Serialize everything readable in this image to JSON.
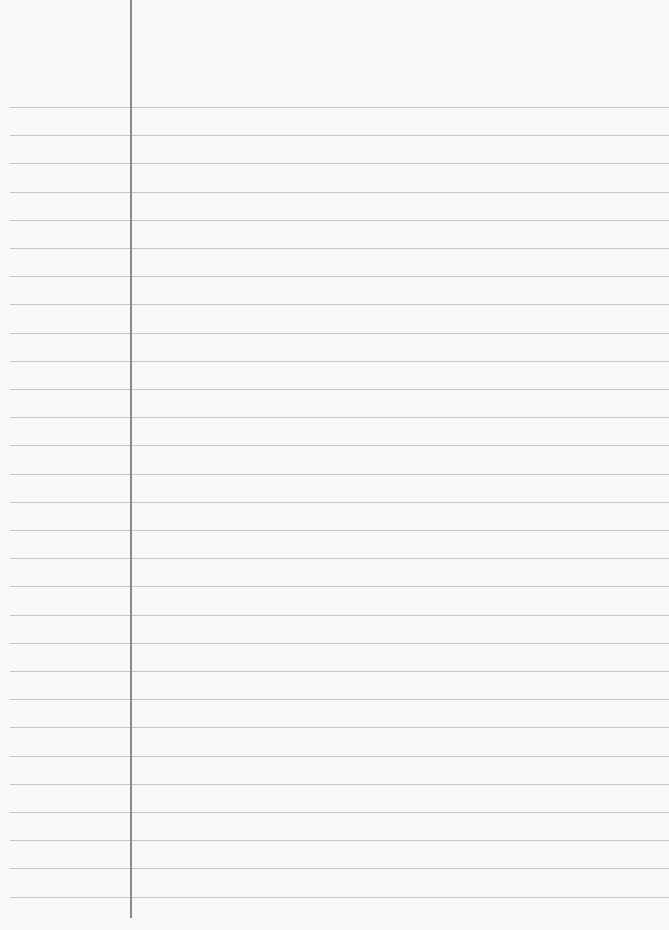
{
  "page": {
    "type": "blank lined paper",
    "text_content": "",
    "rule_count": 29,
    "rule_start_y": 107,
    "rule_spacing_px": 28.2,
    "margin_line_x": 130,
    "colors": {
      "paper": "#f8f8f7",
      "rule": "#bdbdbd",
      "margin_line": "#8a8a8a"
    }
  }
}
